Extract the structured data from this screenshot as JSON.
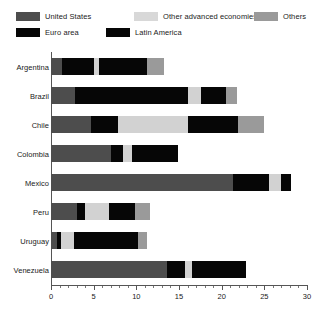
{
  "chart_data": {
    "type": "bar",
    "orientation": "horizontal",
    "stacked": true,
    "title": "",
    "subtitle": "",
    "xlabel": "",
    "ylabel": "",
    "xlim": [
      0,
      30
    ],
    "xticks": [
      0,
      5,
      10,
      15,
      20,
      25,
      30
    ],
    "xtick_labels": [
      "0",
      "5",
      "10",
      "15",
      "20",
      "25",
      "30"
    ],
    "minor_tick_step": 1,
    "grid": false,
    "legend_position": "top",
    "categories": [
      "Argentina",
      "Brazil",
      "Chile",
      "Colombia",
      "Mexico",
      "Peru",
      "Uruguay",
      "Venezuela"
    ],
    "series": [
      {
        "name": "United States",
        "color": "#4d4d4d",
        "values": [
          1.3,
          2.8,
          4.7,
          7.0,
          21.3,
          3.1,
          0.7,
          13.6
        ]
      },
      {
        "name": "Euro area",
        "color": "#060606",
        "values": [
          3.7,
          13.3,
          3.1,
          1.4,
          0.0,
          0.9,
          0.5,
          2.1
        ]
      },
      {
        "name": "Other advanced economies",
        "color": "#d2d2d2",
        "values": [
          0.6,
          1.5,
          8.2,
          1.1,
          0.0,
          2.8,
          1.5,
          0.8
        ]
      },
      {
        "name": "Latin America",
        "color": "#060606",
        "values": [
          5.7,
          2.9,
          5.9,
          5.4,
          4.3,
          3.0,
          7.5,
          6.4
        ]
      },
      {
        "name": "Others",
        "color": "#9a9a9a",
        "values": [
          1.9,
          1.3,
          3.1,
          0.0,
          1.4,
          1.8,
          1.1,
          0.0
        ]
      }
    ],
    "extra_segments": {
      "Mexico": [
        {
          "series": "Other advanced economies",
          "start": 25.6,
          "end": 27.0,
          "color": "#d2d2d2"
        },
        {
          "series": "Latin America",
          "start": 27.0,
          "end": 28.1,
          "color": "#060606"
        }
      ]
    },
    "totals": [
      13.2,
      21.8,
      25.0,
      14.9,
      28.1,
      11.6,
      11.3,
      22.9
    ]
  },
  "legend": {
    "items": [
      {
        "label": "United States",
        "color": "#4d4d4d",
        "row": 0,
        "x": 16
      },
      {
        "label": "Other advanced economies",
        "color": "#d8d8d8",
        "row": 0,
        "x": 134
      },
      {
        "label": "Others",
        "color": "#9a9a9a",
        "row": 0,
        "x": 254
      },
      {
        "label": "Euro area",
        "color": "#060606",
        "row": 1,
        "x": 16
      },
      {
        "label": "Latin America",
        "color": "#060606",
        "row": 1,
        "x": 106
      }
    ]
  },
  "axis": {
    "x_labels": [
      "0",
      "5",
      "10",
      "15",
      "20",
      "25",
      "30"
    ]
  }
}
